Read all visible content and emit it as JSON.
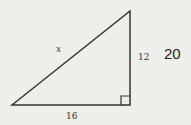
{
  "diagram": {
    "type": "right-triangle",
    "hypotenuse_label": "x",
    "vertical_leg_label": "12",
    "horizontal_leg_label": "16",
    "answer": "20",
    "colors": {
      "background": "#eeeeea",
      "stroke": "#333333"
    }
  }
}
